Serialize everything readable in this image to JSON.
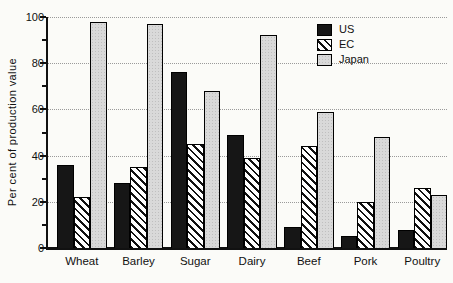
{
  "chart_data": {
    "type": "bar",
    "title": "",
    "ylabel": "Per cent of production value",
    "xlabel": "",
    "ylim": [
      0,
      100
    ],
    "yticks": [
      0,
      20,
      40,
      60,
      80,
      100
    ],
    "minor_ytick_step": 10,
    "grid": "horizontal dotted lines at major y ticks",
    "legend_position": "top-right-inside",
    "categories": [
      "Wheat",
      "Barley",
      "Sugar",
      "Dairy",
      "Beef",
      "Pork",
      "Poultry"
    ],
    "series": [
      {
        "name": "US",
        "pattern": "solid-black",
        "values": [
          36,
          28,
          76,
          49,
          9,
          5,
          8
        ]
      },
      {
        "name": "EC",
        "pattern": "diagonal-hatch",
        "values": [
          22,
          35,
          45,
          39,
          44,
          20,
          26
        ]
      },
      {
        "name": "Japan",
        "pattern": "gray-stipple",
        "values": [
          98,
          97,
          68,
          92,
          59,
          48,
          23
        ]
      }
    ]
  },
  "legend": {
    "items": [
      {
        "label": "US",
        "pattern": "solid-black"
      },
      {
        "label": "EC",
        "pattern": "diagonal-hatch"
      },
      {
        "label": "Japan",
        "pattern": "gray-stipple"
      }
    ]
  },
  "colors": {
    "background": "#fbfbf8",
    "bar_black": "#161616",
    "bar_outline": "#000000",
    "hatch_line": "#111111",
    "hatch_bg": "#ffffff",
    "japan_gray": "#d9d9d9",
    "japan_dot": "#bfbfbf",
    "gridline": "#9a9a9a",
    "axis": "#111111",
    "text": "#111111"
  }
}
